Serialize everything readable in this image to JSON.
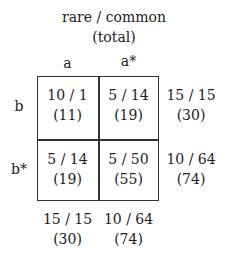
{
  "header": {
    "line1": "rare / common",
    "line2": "(total)"
  },
  "columns": [
    "a",
    "a*"
  ],
  "rows": [
    "b",
    "b*"
  ],
  "cells": [
    [
      {
        "ratio": "10 / 1",
        "total": "(11)"
      },
      {
        "ratio": "5 / 14",
        "total": "(19)"
      }
    ],
    [
      {
        "ratio": "5 / 14",
        "total": "(19)"
      },
      {
        "ratio": "5 / 50",
        "total": "(55)"
      }
    ]
  ],
  "row_margins": [
    {
      "ratio": "15 / 15",
      "total": "(30)"
    },
    {
      "ratio": "10 / 64",
      "total": "(74)"
    }
  ],
  "col_margins": [
    {
      "ratio": "15 / 15",
      "total": "(30)"
    },
    {
      "ratio": "10 / 64",
      "total": "(74)"
    }
  ]
}
